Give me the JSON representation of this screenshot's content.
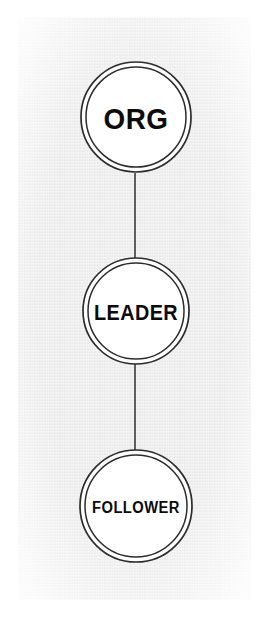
{
  "canvas": {
    "width": 269,
    "height": 617,
    "background_color": "#ffffff",
    "panel_color": "#ededed"
  },
  "diagram": {
    "type": "node-link-chain",
    "orientation": "vertical",
    "node_shape": "double-ring-circle",
    "node_fill": "#ffffff",
    "stroke_color": "#2c2c2c",
    "edge_color": "#3a3a3a",
    "label_color": "#0b0b0b",
    "nodes": [
      {
        "id": "org",
        "label": "ORG",
        "cx": 136,
        "cy": 117,
        "r_outer": 55,
        "r_inner": 50
      },
      {
        "id": "leader",
        "label": "LEADER",
        "cx": 136,
        "cy": 311,
        "r_outer": 53,
        "r_inner": 48
      },
      {
        "id": "follower",
        "label": "FOLLOWER",
        "cx": 136,
        "cy": 506,
        "r_outer": 56,
        "r_inner": 51
      }
    ],
    "edges": [
      {
        "id": "org-to-leader",
        "from": "org",
        "to": "leader",
        "x": 135,
        "y1": 173,
        "y2": 258
      },
      {
        "id": "leader-to-follower",
        "from": "leader",
        "to": "follower",
        "x": 135,
        "y1": 364,
        "y2": 450
      }
    ]
  }
}
